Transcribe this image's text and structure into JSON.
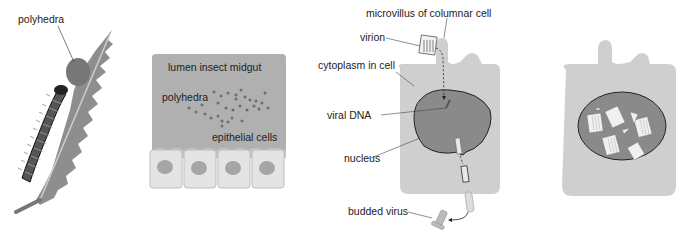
{
  "panels": {
    "leaf": {
      "labels": {
        "polyhedra": "polyhedra"
      }
    },
    "midgut": {
      "labels": {
        "lumen": "lumen insect midgut",
        "polyhedra": "polyhedra",
        "epithelial": "epithelial cells"
      }
    },
    "infected_cell": {
      "labels": {
        "microvillus": "microvillus of columnar cell",
        "virion": "virion",
        "cytoplasm": "cytoplasm in cell",
        "viral_dna": "viral DNA",
        "nucleus": "nucleus",
        "budded_virus": "budded virus"
      }
    },
    "late_cell": {
      "labels": {}
    }
  },
  "colors": {
    "leaf": "#8e8e8e",
    "caterpillar": "#555555",
    "lumen": "#b0b0b0",
    "cell": "#cfcfcf",
    "cell_light": "#e4e4e4",
    "nucleus": "#8a8a8a",
    "dots": "#6e6e6e",
    "outline": "#222222"
  }
}
